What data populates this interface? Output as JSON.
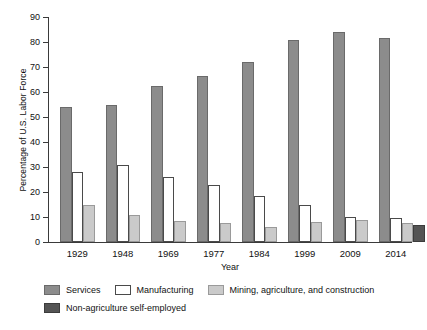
{
  "chart_data": {
    "type": "bar",
    "title": "",
    "xlabel": "Year",
    "ylabel": "Percentage of U.S. Labor Force",
    "categories": [
      "1929",
      "1948",
      "1969",
      "1977",
      "1984",
      "1999",
      "2009",
      "2014"
    ],
    "ylim": [
      0,
      90
    ],
    "yticks": [
      0,
      10,
      20,
      30,
      40,
      50,
      60,
      70,
      80,
      90
    ],
    "grid": false,
    "legend_position": "bottom",
    "series": [
      {
        "name": "Services",
        "color": "#8c8c8c",
        "values": [
          54,
          55,
          62.5,
          66.5,
          72,
          81,
          84,
          81.5
        ]
      },
      {
        "name": "Manufacturing",
        "color": "#ffffff",
        "values": [
          28,
          31,
          26,
          23,
          18.5,
          15,
          10,
          9.5
        ]
      },
      {
        "name": "Mining, agriculture, and construction",
        "color": "#cacaca",
        "values": [
          15,
          11,
          8.5,
          7.5,
          6,
          8,
          9,
          7.5
        ]
      },
      {
        "name": "Non-agriculture self-employed",
        "color": "#545454",
        "values": [
          null,
          null,
          null,
          null,
          null,
          null,
          null,
          7
        ]
      }
    ]
  },
  "axis": {
    "y_title": "Percentage of U.S. Labor Force",
    "x_title": "Year",
    "y_tick_labels": [
      "90",
      "80",
      "70",
      "60",
      "50",
      "40",
      "30",
      "20",
      "10",
      "0"
    ]
  },
  "legend": {
    "row1": [
      {
        "label": "Services",
        "swatch": "services"
      },
      {
        "label": "Manufacturing",
        "swatch": "manufacturing"
      },
      {
        "label": "Mining, agriculture, and construction",
        "swatch": "mining"
      }
    ],
    "row2": [
      {
        "label": "Non-agriculture self-employed",
        "swatch": "selfemployed"
      }
    ]
  }
}
